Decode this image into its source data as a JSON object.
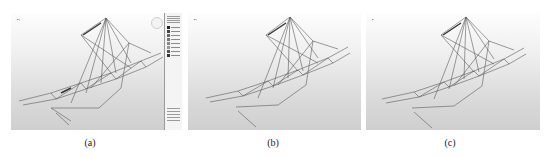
{
  "figure": {
    "panels": [
      {
        "id": "a",
        "caption": "(a)",
        "has_legend": true
      },
      {
        "id": "b",
        "caption": "(b)",
        "has_legend": false
      },
      {
        "id": "c",
        "caption": "(c)",
        "has_legend": false
      }
    ],
    "colors": {
      "background_top": "#fdfdfd",
      "background_bottom": "#cfcfcf",
      "wireframe": "#555555",
      "caption_text": "#222222"
    }
  }
}
